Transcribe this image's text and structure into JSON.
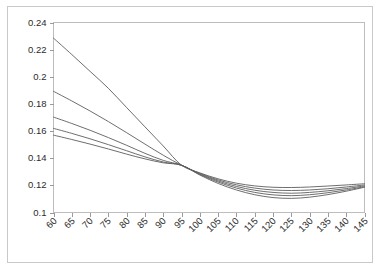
{
  "chart_data": {
    "type": "line",
    "title": "",
    "subtitle": "",
    "xlabel": "",
    "ylabel": "",
    "grid": false,
    "legend": "none",
    "xlim": [
      60,
      145
    ],
    "ylim": [
      0.1,
      0.24
    ],
    "x_ticks": [
      60,
      65,
      70,
      75,
      80,
      85,
      90,
      95,
      100,
      105,
      110,
      115,
      120,
      125,
      130,
      135,
      140,
      145
    ],
    "x_tick_labels": [
      "60",
      "65",
      "70",
      "75",
      "80",
      "85",
      "90",
      "95",
      "100",
      "105",
      "110",
      "115",
      "120",
      "125",
      "130",
      "135",
      "140",
      "145"
    ],
    "x_tick_label_rotation": 45,
    "y_ticks": [
      0.1,
      0.12,
      0.14,
      0.16,
      0.18,
      0.2,
      0.22,
      0.24
    ],
    "y_tick_labels": [
      "0.1",
      "0.12",
      "0.14",
      "0.16",
      "0.18",
      "0.2",
      "0.22",
      "0.24"
    ],
    "crossing_point": {
      "x": 95,
      "y": 0.1348
    },
    "x": [
      60,
      65,
      70,
      75,
      80,
      85,
      90,
      95,
      100,
      105,
      110,
      115,
      120,
      125,
      130,
      135,
      140,
      145
    ],
    "series": [
      {
        "name": "series-1",
        "color": "#5d5d5d",
        "values": [
          0.2285,
          0.2164,
          0.204,
          0.1915,
          0.1773,
          0.1631,
          0.149,
          0.1348,
          0.1292,
          0.1248,
          0.1216,
          0.1196,
          0.1186,
          0.1184,
          0.1188,
          0.1195,
          0.1203,
          0.1212
        ]
      },
      {
        "name": "series-2",
        "color": "#5d5d5d",
        "values": [
          0.1893,
          0.1822,
          0.1748,
          0.167,
          0.1588,
          0.1504,
          0.1422,
          0.1348,
          0.1288,
          0.124,
          0.1204,
          0.118,
          0.1166,
          0.1162,
          0.1166,
          0.1175,
          0.1188,
          0.1203
        ]
      },
      {
        "name": "series-3",
        "color": "#5d5d5d",
        "values": [
          0.1703,
          0.1656,
          0.1606,
          0.1552,
          0.1495,
          0.1436,
          0.1384,
          0.1348,
          0.1284,
          0.1232,
          0.1192,
          0.1164,
          0.1148,
          0.1142,
          0.1148,
          0.116,
          0.1176,
          0.1196
        ]
      },
      {
        "name": "series-4",
        "color": "#5d5d5d",
        "values": [
          0.162,
          0.1583,
          0.1543,
          0.15,
          0.1455,
          0.141,
          0.1372,
          0.1348,
          0.128,
          0.1224,
          0.118,
          0.1148,
          0.113,
          0.1124,
          0.1131,
          0.1146,
          0.1166,
          0.119
        ]
      },
      {
        "name": "series-5",
        "color": "#5d5d5d",
        "values": [
          0.157,
          0.1538,
          0.1504,
          0.1468,
          0.143,
          0.1395,
          0.1366,
          0.1348,
          0.1276,
          0.1214,
          0.1166,
          0.1131,
          0.111,
          0.1104,
          0.1113,
          0.1132,
          0.1157,
          0.1186
        ]
      }
    ]
  }
}
